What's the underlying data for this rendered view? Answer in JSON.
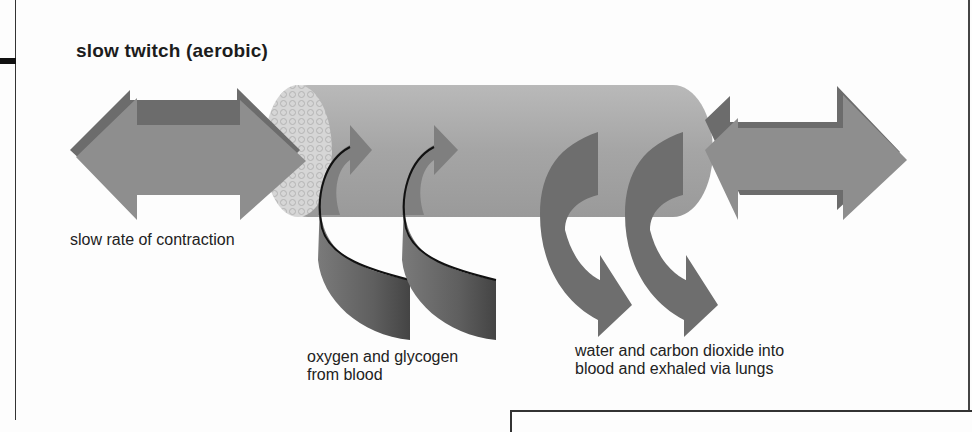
{
  "title": "slow twitch (aerobic)",
  "labels": {
    "contraction": "slow rate of contraction",
    "inflow": "oxygen and glycogen\nfrom blood",
    "inflow_line1": "oxygen and glycogen",
    "inflow_line2": "from blood",
    "outflow_line1": "water and carbon dioxide into",
    "outflow_line2": "blood and exhaled via lungs"
  },
  "elements": {
    "muscle_fibre": "cylinder",
    "left_arrow": "double-arrow",
    "right_arrow": "double-arrow",
    "inflow_arrows": 2,
    "outflow_arrows": 2
  },
  "colors": {
    "arrow_fill": "#8a8a8a",
    "arrow_dark": "#5e5e5e",
    "cylinder": "#a9a9a9",
    "cylinder_end": "#d4d4d4",
    "ribbon": "#6f6f6f",
    "text": "#1c1c1c"
  }
}
